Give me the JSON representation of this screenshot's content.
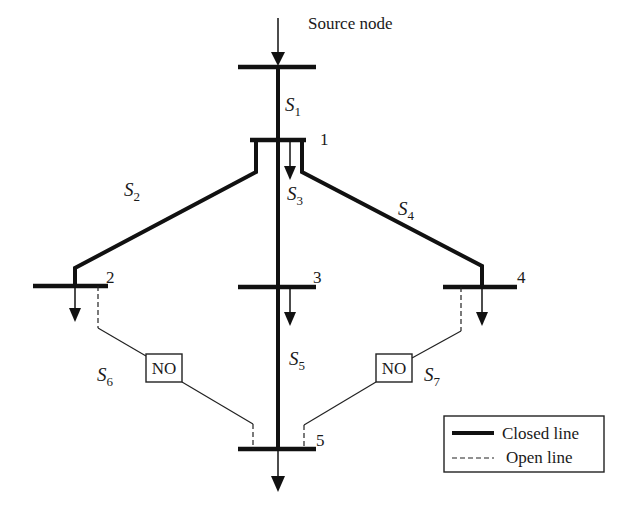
{
  "diagram": {
    "source_label": "Source node",
    "nodes": [
      {
        "id": "1",
        "label": "1"
      },
      {
        "id": "2",
        "label": "2"
      },
      {
        "id": "3",
        "label": "3"
      },
      {
        "id": "4",
        "label": "4"
      },
      {
        "id": "5",
        "label": "5"
      }
    ],
    "switches": [
      {
        "id": "S1",
        "base": "S",
        "sub": "1",
        "state": "closed"
      },
      {
        "id": "S2",
        "base": "S",
        "sub": "2",
        "state": "closed"
      },
      {
        "id": "S3",
        "base": "S",
        "sub": "3",
        "state": "closed"
      },
      {
        "id": "S4",
        "base": "S",
        "sub": "4",
        "state": "closed"
      },
      {
        "id": "S5",
        "base": "S",
        "sub": "5",
        "state": "closed"
      },
      {
        "id": "S6",
        "base": "S",
        "sub": "6",
        "state": "open"
      },
      {
        "id": "S7",
        "base": "S",
        "sub": "7",
        "state": "open"
      }
    ],
    "normally_open": [
      {
        "switch": "S6",
        "label": "NO"
      },
      {
        "switch": "S7",
        "label": "NO"
      }
    ],
    "edges": [
      {
        "from": "source",
        "to": "1",
        "switch": "S1",
        "type": "closed"
      },
      {
        "from": "1",
        "to": "2",
        "switch": "S2",
        "type": "closed"
      },
      {
        "from": "1",
        "to": "3",
        "switch": "S3",
        "type": "closed"
      },
      {
        "from": "1",
        "to": "4",
        "switch": "S4",
        "type": "closed"
      },
      {
        "from": "3",
        "to": "5",
        "switch": "S5",
        "type": "closed"
      },
      {
        "from": "2",
        "to": "5",
        "switch": "S6",
        "type": "open"
      },
      {
        "from": "4",
        "to": "5",
        "switch": "S7",
        "type": "open"
      }
    ],
    "legend": {
      "closed_label": "Closed line",
      "open_label": "Open line"
    },
    "colors": {
      "line": "#111111",
      "background": "#ffffff"
    }
  }
}
